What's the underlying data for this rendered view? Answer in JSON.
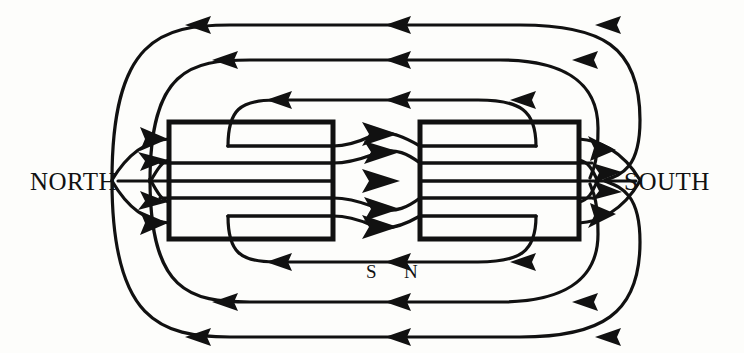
{
  "diagram": {
    "type": "magnetic-field-line-diagram",
    "background_color": "#fdfdfb",
    "ink_color": "#111111",
    "labels": {
      "north": "NORTH",
      "south": "SOUTH",
      "inner_south": "S",
      "inner_north": "N"
    },
    "magnets": [
      {
        "name": "left-magnet",
        "x": 169,
        "y": 122,
        "width": 164,
        "height": 117,
        "left_pole": "NORTH",
        "right_pole": "S"
      },
      {
        "name": "right-magnet",
        "x": 420,
        "y": 122,
        "width": 159,
        "height": 117,
        "left_pole": "N",
        "right_pole": "SOUTH"
      }
    ],
    "gap": {
      "x_start": 333,
      "x_end": 420,
      "arrow_count": 5,
      "arrow_direction": "right"
    },
    "field_lines": {
      "outer_loops_above": 3,
      "outer_loops_below": 3,
      "axis_line": 1,
      "direction": "from SOUTH pole around to NORTH pole (arrows point left on outer lines)"
    },
    "arrow_directions": {
      "outer_horizontal": "left",
      "gap_arrows": "right",
      "converging_at_north": "right",
      "converging_at_south": "right"
    }
  }
}
